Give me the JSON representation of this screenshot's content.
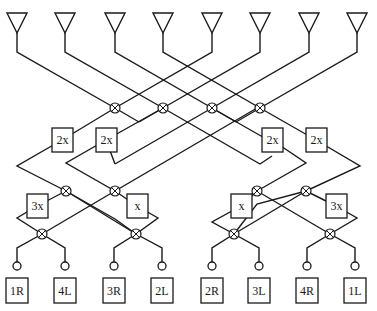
{
  "diagram": {
    "title": "",
    "type": "butler-matrix",
    "colors": {
      "stroke": "#1a1a1a",
      "background": "#ffffff"
    },
    "antennas": [
      {
        "id": "A1",
        "x": 17
      },
      {
        "id": "A2",
        "x": 65
      },
      {
        "id": "A3",
        "x": 115
      },
      {
        "id": "A4",
        "x": 163
      },
      {
        "id": "A5",
        "x": 212
      },
      {
        "id": "A6",
        "x": 260
      },
      {
        "id": "A7",
        "x": 309
      },
      {
        "id": "A8",
        "x": 357
      }
    ],
    "hybrids": [
      {
        "id": "H-top-1",
        "x": 115,
        "y": 108
      },
      {
        "id": "H-top-2",
        "x": 163,
        "y": 108
      },
      {
        "id": "H-top-3",
        "x": 212,
        "y": 108
      },
      {
        "id": "H-top-4",
        "x": 260,
        "y": 108
      },
      {
        "id": "H-mid-1",
        "x": 66,
        "y": 191
      },
      {
        "id": "H-mid-2",
        "x": 115,
        "y": 191
      },
      {
        "id": "H-mid-3",
        "x": 257,
        "y": 191
      },
      {
        "id": "H-mid-4",
        "x": 306,
        "y": 191
      },
      {
        "id": "H-bot-1",
        "x": 42,
        "y": 234
      },
      {
        "id": "H-bot-2",
        "x": 136,
        "y": 234
      },
      {
        "id": "H-bot-3",
        "x": 234,
        "y": 234
      },
      {
        "id": "H-bot-4",
        "x": 330,
        "y": 234
      }
    ],
    "phase_shifters": [
      {
        "label": "2x",
        "x": 62,
        "y": 140
      },
      {
        "label": "2x",
        "x": 106,
        "y": 140
      },
      {
        "label": "2x",
        "x": 272,
        "y": 140
      },
      {
        "label": "2x",
        "x": 316,
        "y": 140
      },
      {
        "label": "3x",
        "x": 37,
        "y": 206
      },
      {
        "label": "x",
        "x": 137,
        "y": 206
      },
      {
        "label": "x",
        "x": 241,
        "y": 206
      },
      {
        "label": "3x",
        "x": 336,
        "y": 206
      }
    ],
    "ports": [
      {
        "label": "1R",
        "x": 17
      },
      {
        "label": "4L",
        "x": 65
      },
      {
        "label": "3R",
        "x": 114
      },
      {
        "label": "2L",
        "x": 162
      },
      {
        "label": "2R",
        "x": 212
      },
      {
        "label": "3L",
        "x": 259
      },
      {
        "label": "4R",
        "x": 307
      },
      {
        "label": "1L",
        "x": 355
      }
    ],
    "wires": [
      [
        [
          17,
          33
        ],
        [
          17,
          52
        ],
        [
          115,
          108
        ],
        [
          139,
          122
        ]
      ],
      [
        [
          65,
          33
        ],
        [
          65,
          52
        ],
        [
          163,
          108
        ],
        [
          260,
          164
        ],
        [
          272,
          156
        ]
      ],
      [
        [
          115,
          33
        ],
        [
          115,
          52
        ],
        [
          212,
          108
        ],
        [
          261,
          136
        ]
      ],
      [
        [
          163,
          33
        ],
        [
          163,
          52
        ],
        [
          260,
          108
        ],
        [
          316,
          140
        ]
      ],
      [
        [
          212,
          33
        ],
        [
          212,
          52
        ],
        [
          115,
          108
        ],
        [
          62,
          140
        ]
      ],
      [
        [
          260,
          33
        ],
        [
          260,
          52
        ],
        [
          163,
          108
        ],
        [
          106,
          140
        ]
      ],
      [
        [
          309,
          33
        ],
        [
          309,
          52
        ],
        [
          212,
          108
        ],
        [
          115,
          164
        ]
      ],
      [
        [
          357,
          33
        ],
        [
          357,
          52
        ],
        [
          260,
          108
        ],
        [
          236,
          122
        ]
      ],
      [
        [
          139,
          122
        ],
        [
          163,
          108
        ]
      ],
      [
        [
          236,
          122
        ],
        [
          212,
          108
        ]
      ],
      [
        [
          261,
          136
        ],
        [
          272,
          140
        ]
      ],
      [
        [
          115,
          164
        ],
        [
          106,
          140
        ]
      ],
      [
        [
          62,
          140
        ],
        [
          17,
          166
        ],
        [
          66,
          191
        ],
        [
          115,
          219
        ],
        [
          136,
          234
        ]
      ],
      [
        [
          106,
          140
        ],
        [
          66,
          163
        ],
        [
          115,
          191
        ],
        [
          257,
          108
        ]
      ],
      [
        [
          272,
          140
        ],
        [
          306,
          163
        ],
        [
          257,
          191
        ],
        [
          234,
          204
        ]
      ],
      [
        [
          316,
          140
        ],
        [
          360,
          166
        ],
        [
          306,
          191
        ],
        [
          257,
          204
        ],
        [
          234,
          234
        ]
      ],
      [
        [
          66,
          191
        ],
        [
          37,
          206
        ]
      ],
      [
        [
          115,
          191
        ],
        [
          137,
          206
        ]
      ],
      [
        [
          257,
          191
        ],
        [
          241,
          206
        ]
      ],
      [
        [
          306,
          191
        ],
        [
          336,
          206
        ]
      ],
      [
        [
          37,
          206
        ],
        [
          17,
          218
        ],
        [
          42,
          234
        ]
      ],
      [
        [
          66,
          191
        ],
        [
          136,
          234
        ]
      ],
      [
        [
          137,
          206
        ],
        [
          158,
          218
        ],
        [
          136,
          234
        ]
      ],
      [
        [
          115,
          191
        ],
        [
          42,
          234
        ]
      ],
      [
        [
          241,
          206
        ],
        [
          212,
          222
        ],
        [
          234,
          234
        ]
      ],
      [
        [
          257,
          191
        ],
        [
          330,
          234
        ]
      ],
      [
        [
          336,
          206
        ],
        [
          357,
          218
        ],
        [
          330,
          234
        ]
      ],
      [
        [
          306,
          191
        ],
        [
          234,
          234
        ]
      ],
      [
        [
          42,
          234
        ],
        [
          17,
          248
        ],
        [
          17,
          262
        ]
      ],
      [
        [
          42,
          234
        ],
        [
          65,
          248
        ],
        [
          65,
          262
        ]
      ],
      [
        [
          136,
          234
        ],
        [
          114,
          248
        ],
        [
          114,
          262
        ]
      ],
      [
        [
          136,
          234
        ],
        [
          162,
          248
        ],
        [
          162,
          262
        ]
      ],
      [
        [
          234,
          234
        ],
        [
          212,
          248
        ],
        [
          212,
          262
        ]
      ],
      [
        [
          234,
          234
        ],
        [
          259,
          248
        ],
        [
          259,
          262
        ]
      ],
      [
        [
          330,
          234
        ],
        [
          307,
          248
        ],
        [
          307,
          262
        ]
      ],
      [
        [
          330,
          234
        ],
        [
          355,
          248
        ],
        [
          355,
          262
        ]
      ]
    ]
  }
}
